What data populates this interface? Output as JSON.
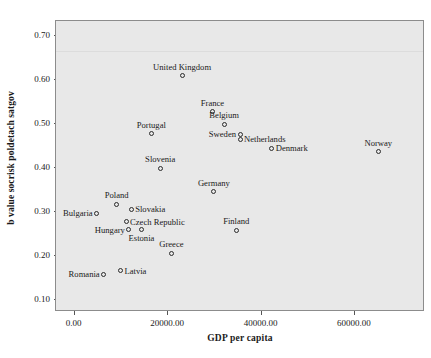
{
  "chart_data": {
    "type": "scatter",
    "title": "",
    "xlabel": "GDP per capita",
    "ylabel": "b value socrisk poldetach satgov",
    "xlim": [
      -4000,
      75000
    ],
    "ylim": [
      0.073,
      0.735
    ],
    "grid": true,
    "legend": "none",
    "x_ticks": [
      {
        "value": 0,
        "label": "0.00"
      },
      {
        "value": 20000,
        "label": "20000.00"
      },
      {
        "value": 40000,
        "label": "40000.00"
      },
      {
        "value": 60000,
        "label": "60000.00"
      }
    ],
    "y_ticks": [
      {
        "value": 0.1,
        "label": "0.10"
      },
      {
        "value": 0.2,
        "label": "0.20"
      },
      {
        "value": 0.3,
        "label": "0.30"
      },
      {
        "value": 0.4,
        "label": "0.40"
      },
      {
        "value": 0.5,
        "label": "0.50"
      },
      {
        "value": 0.6,
        "label": "0.60"
      },
      {
        "value": 0.7,
        "label": "0.70"
      }
    ],
    "gridlines_y": [
      0.666
    ],
    "points": [
      {
        "label": "United Kingdom",
        "x": 23000,
        "y": 0.61,
        "label_pos": "top"
      },
      {
        "label": "France",
        "x": 29500,
        "y": 0.528,
        "label_pos": "top"
      },
      {
        "label": "Belgium",
        "x": 32000,
        "y": 0.5,
        "label_pos": "top"
      },
      {
        "label": "Portugal",
        "x": 16400,
        "y": 0.479,
        "label_pos": "top"
      },
      {
        "label": "Sweden",
        "x": 35400,
        "y": 0.477,
        "label_pos": "left"
      },
      {
        "label": "Netherlands",
        "x": 35400,
        "y": 0.466,
        "label_pos": "right"
      },
      {
        "label": "Denmark",
        "x": 42200,
        "y": 0.446,
        "label_pos": "right"
      },
      {
        "label": "Norway",
        "x": 65000,
        "y": 0.438,
        "label_pos": "top"
      },
      {
        "label": "Slovenia",
        "x": 18300,
        "y": 0.4,
        "label_pos": "top"
      },
      {
        "label": "Germany",
        "x": 29800,
        "y": 0.347,
        "label_pos": "top"
      },
      {
        "label": "Poland",
        "x": 9000,
        "y": 0.318,
        "label_pos": "top"
      },
      {
        "label": "Slovakia",
        "x": 12100,
        "y": 0.307,
        "label_pos": "right"
      },
      {
        "label": "Bulgaria",
        "x": 4700,
        "y": 0.298,
        "label_pos": "left"
      },
      {
        "label": "Czech Republic",
        "x": 11000,
        "y": 0.278,
        "label_pos": "right"
      },
      {
        "label": "Hungary",
        "x": 11600,
        "y": 0.26,
        "label_pos": "left"
      },
      {
        "label": "Estonia",
        "x": 14300,
        "y": 0.26,
        "label_pos": "bottom"
      },
      {
        "label": "Finland",
        "x": 34600,
        "y": 0.259,
        "label_pos": "top"
      },
      {
        "label": "Greece",
        "x": 20700,
        "y": 0.207,
        "label_pos": "top"
      },
      {
        "label": "Latvia",
        "x": 9800,
        "y": 0.167,
        "label_pos": "right"
      },
      {
        "label": "Romania",
        "x": 6200,
        "y": 0.159,
        "label_pos": "left"
      }
    ]
  }
}
